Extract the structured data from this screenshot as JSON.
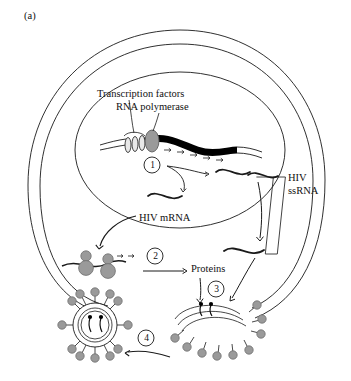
{
  "figure": {
    "panel_label": "(a)",
    "title_alt": "HIV replication cycle inside a host cell",
    "background_color": "#ffffff",
    "line_color": "#1a1a1a",
    "gray_fill": "#9a9a9a",
    "gray_stroke": "#6e6e6e",
    "dna_color": "#000000"
  },
  "labels": {
    "transcription_factors": "Transcription factors",
    "rna_polymerase": "RNA polymerase",
    "hiv_ssrna_line1": "HIV",
    "hiv_ssrna_line2": "ssRNA",
    "hiv_mrna": "HIV mRNA",
    "proteins": "Proteins"
  },
  "steps": [
    {
      "id": "step-1",
      "number": "1",
      "meaning": "transcription of integrated provirus in nucleus"
    },
    {
      "id": "step-2",
      "number": "2",
      "meaning": "translation of HIV mRNA by ribosomes"
    },
    {
      "id": "step-3",
      "number": "3",
      "meaning": "assembly of virion at plasma membrane"
    },
    {
      "id": "step-4",
      "number": "4",
      "meaning": "budding and release of mature virion"
    }
  ],
  "structures": {
    "cell_membrane": "outer cell boundary",
    "cytoplasm": "inner cell boundary",
    "nucleus": "nuclear envelope",
    "dna_strand": "host chromosomal DNA with integrated provirus",
    "transcription_factor_count": 3,
    "ribosome_count": 4,
    "virion_spike_count_mature": 12,
    "virion_spike_count_budding": 9
  }
}
